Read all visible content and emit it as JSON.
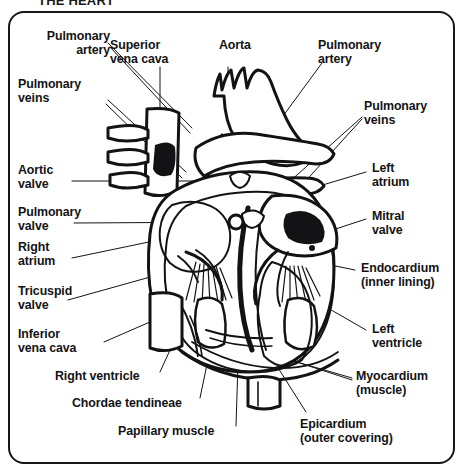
{
  "document": {
    "title": "THE HEART",
    "subject": "anatomical cross-section diagram of the human heart",
    "style": "black and white line drawing"
  },
  "frame": {
    "border_color": "#17161a",
    "background_color": "#ffffff"
  },
  "labels": [
    {
      "id": "pulmonary-artery-left",
      "text": "Pulmonary\nartery",
      "align": "right",
      "x": 14,
      "y": 29,
      "w": 92
    },
    {
      "id": "superior-vena-cava",
      "text": "Superior\nvena cava",
      "align": "left",
      "x": 110,
      "y": 38,
      "w": 90
    },
    {
      "id": "aorta",
      "text": "Aorta",
      "align": "left",
      "x": 219,
      "y": 38,
      "w": 60
    },
    {
      "id": "pulmonary-artery-right",
      "text": "Pulmonary\nartery",
      "align": "left",
      "x": 318,
      "y": 38,
      "w": 92
    },
    {
      "id": "pulmonary-veins-left",
      "text": "Pulmonary\nveins",
      "align": "left",
      "x": 18,
      "y": 77,
      "w": 92
    },
    {
      "id": "pulmonary-veins-right",
      "text": "Pulmonary\nveins",
      "align": "left",
      "x": 364,
      "y": 99,
      "w": 92
    },
    {
      "id": "aortic-valve",
      "text": "Aortic\nvalve",
      "align": "left",
      "x": 18,
      "y": 163,
      "w": 70
    },
    {
      "id": "left-atrium",
      "text": "Left\natrium",
      "align": "left",
      "x": 372,
      "y": 161,
      "w": 70
    },
    {
      "id": "pulmonary-valve",
      "text": "Pulmonary\nvalve",
      "align": "left",
      "x": 18,
      "y": 205,
      "w": 92
    },
    {
      "id": "mitral-valve",
      "text": "Mitral\nvalve",
      "align": "left",
      "x": 372,
      "y": 209,
      "w": 70
    },
    {
      "id": "right-atrium",
      "text": "Right\natrium",
      "align": "left",
      "x": 18,
      "y": 240,
      "w": 70
    },
    {
      "id": "endocardium",
      "text": "Endocardium\n(inner lining)",
      "align": "left",
      "x": 361,
      "y": 261,
      "w": 104
    },
    {
      "id": "tricuspid-valve",
      "text": "Tricuspid\nvalve",
      "align": "left",
      "x": 18,
      "y": 284,
      "w": 86
    },
    {
      "id": "inferior-vena-cava",
      "text": "Inferior\nvena cava",
      "align": "left",
      "x": 18,
      "y": 327,
      "w": 90
    },
    {
      "id": "left-ventricle",
      "text": "Left\nventricle",
      "align": "left",
      "x": 372,
      "y": 322,
      "w": 80
    },
    {
      "id": "right-ventricle",
      "text": "Right ventricle",
      "align": "left",
      "x": 55,
      "y": 369,
      "w": 106
    },
    {
      "id": "myocardium",
      "text": "Myocardium\n(muscle)",
      "align": "left",
      "x": 356,
      "y": 369,
      "w": 102
    },
    {
      "id": "chordae-tendineae",
      "text": "Chordae tendineae",
      "align": "left",
      "x": 72,
      "y": 396,
      "w": 126
    },
    {
      "id": "papillary-muscle",
      "text": "Papillary muscle",
      "align": "left",
      "x": 118,
      "y": 424,
      "w": 118
    },
    {
      "id": "epicardium",
      "text": "Epicardium\n(outer covering)",
      "align": "left",
      "x": 300,
      "y": 417,
      "w": 132
    }
  ],
  "structures": [
    "aorta",
    "superior vena cava",
    "inferior vena cava",
    "pulmonary artery",
    "pulmonary veins",
    "right atrium",
    "left atrium",
    "right ventricle",
    "left ventricle",
    "aortic valve",
    "pulmonary valve",
    "mitral valve",
    "tricuspid valve",
    "chordae tendineae",
    "papillary muscle",
    "endocardium",
    "myocardium",
    "epicardium"
  ]
}
